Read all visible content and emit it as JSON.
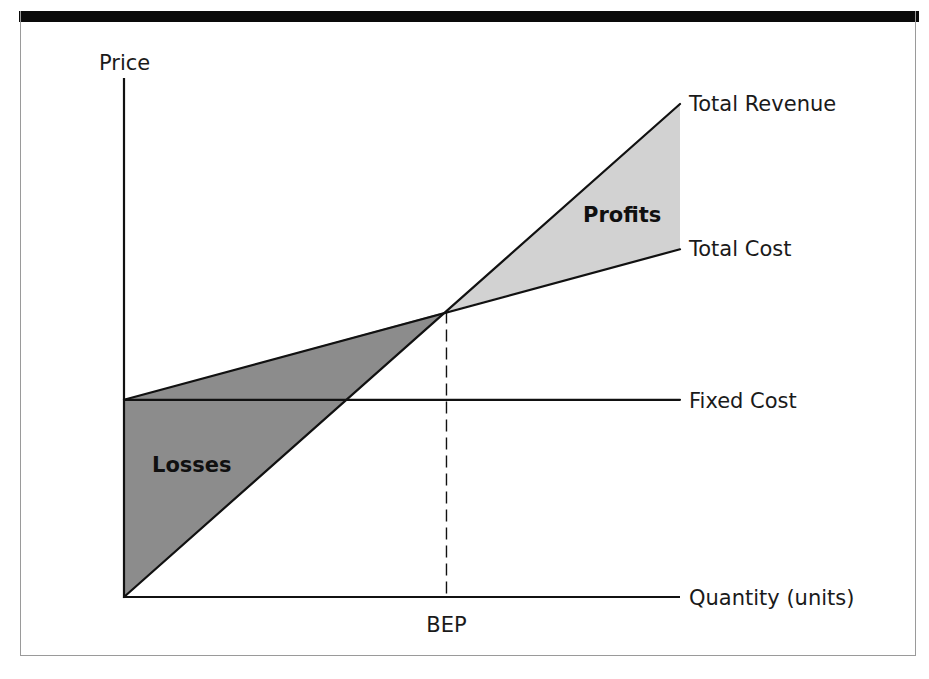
{
  "chart_data": {
    "type": "line",
    "title": "",
    "xlabel": "Quantity (units)",
    "ylabel": "Price",
    "xlim": [
      0,
      100
    ],
    "ylim": [
      0,
      100
    ],
    "grid": false,
    "series": [
      {
        "name": "Total Revenue",
        "x": [
          0,
          100
        ],
        "y": [
          0,
          95
        ]
      },
      {
        "name": "Total Cost",
        "x": [
          0,
          100
        ],
        "y": [
          38,
          67
        ]
      },
      {
        "name": "Fixed Cost",
        "x": [
          0,
          100
        ],
        "y": [
          38,
          38
        ]
      }
    ],
    "break_even": {
      "label": "BEP",
      "x": 58,
      "y": 55
    },
    "regions": [
      {
        "name": "Losses",
        "label": "Losses",
        "color": "#8c8c8c",
        "between": [
          "Total Cost",
          "Total Revenue"
        ],
        "x_range": [
          0,
          58
        ]
      },
      {
        "name": "Profits",
        "label": "Profits",
        "color": "#d2d2d2",
        "between": [
          "Total Revenue",
          "Total Cost"
        ],
        "x_range": [
          58,
          100
        ]
      }
    ],
    "line_labels_position": "right-end",
    "line_color": "#111111"
  }
}
